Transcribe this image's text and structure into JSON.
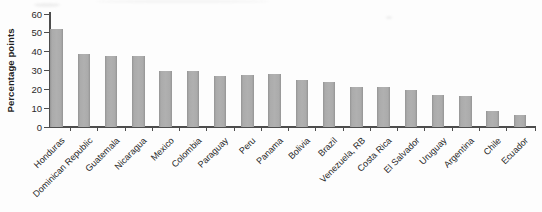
{
  "figure": {
    "ylabel": "Percentage points",
    "colors": {
      "bar_fill": "#a8a8a8",
      "bar_edge": "#949494",
      "axis": "#4d4d4d",
      "text": "#262626",
      "background": "#fdfdfd"
    }
  },
  "chart_data": {
    "type": "bar",
    "title": "",
    "xlabel": "",
    "ylabel": "Percentage points",
    "categories": [
      "Honduras",
      "Dominican Republic",
      "Guatemala",
      "Nicaragua",
      "Mexico",
      "Colombia",
      "Paraguay",
      "Peru",
      "Panama",
      "Bolivia",
      "Brazil",
      "Venezuela, RB",
      "Costa Rica",
      "El Salvador",
      "Uruguay",
      "Argentina",
      "Chile",
      "Ecuador"
    ],
    "values": [
      52,
      38.5,
      37.5,
      37.5,
      30,
      30,
      27,
      27.5,
      28,
      25,
      24,
      21.5,
      21.5,
      19.5,
      17,
      16.5,
      8.5,
      6.5
    ],
    "ylim": [
      0,
      60
    ],
    "yticks": [
      0,
      10,
      20,
      30,
      40,
      50,
      60
    ],
    "grid": false,
    "legend": false,
    "bar_color": "#a8a8a8",
    "tick_label_rotation_deg": -45
  }
}
